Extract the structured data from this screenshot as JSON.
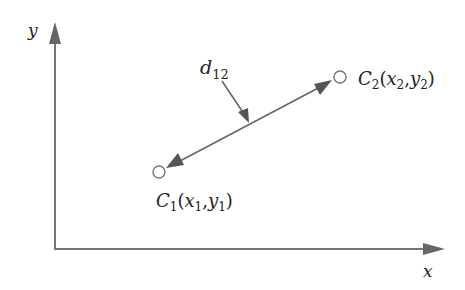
{
  "diagram": {
    "type": "coordinate-distance",
    "axes": {
      "x_label": "x",
      "y_label": "y",
      "color": "#777777"
    },
    "points": [
      {
        "id": "C1",
        "name": "C",
        "sub": "1",
        "coord_label": {
          "x": "x",
          "x_sub": "1",
          "y": "y",
          "y_sub": "1"
        }
      },
      {
        "id": "C2",
        "name": "C",
        "sub": "2",
        "coord_label": {
          "x": "x",
          "x_sub": "2",
          "y": "y",
          "y_sub": "2"
        }
      }
    ],
    "distance_label": {
      "name": "d",
      "sub": "12"
    },
    "colors": {
      "line": "#666666",
      "arrow": "#555555",
      "text": "#222222"
    }
  }
}
